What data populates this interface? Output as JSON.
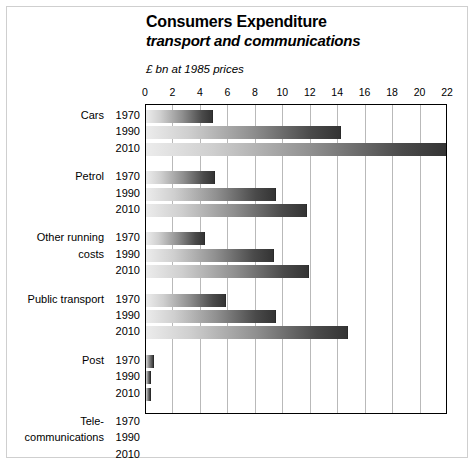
{
  "title": {
    "main": "Consumers Expenditure",
    "sub": "transport and communications"
  },
  "units": "£ bn at 1985 prices",
  "chart_data": {
    "type": "bar",
    "orientation": "horizontal",
    "title": "Consumers Expenditure transport and communications",
    "subtitle": "transport and communications",
    "xlabel": "£ bn at 1985 prices",
    "ylabel": "",
    "xlim": [
      0,
      22
    ],
    "xticks": [
      0,
      2,
      4,
      6,
      8,
      10,
      12,
      14,
      16,
      18,
      20,
      22
    ],
    "xtick_labels": [
      "0",
      "2",
      "4",
      "6",
      "8",
      "10",
      "12",
      "14",
      "16",
      "18",
      "20",
      "22"
    ],
    "grid": "vertical",
    "legend": "none",
    "categories": [
      "Cars",
      "Petrol",
      "Other running costs",
      "Public transport",
      "Post",
      "Tele-communications"
    ],
    "category_label_lines": [
      [
        "Cars"
      ],
      [
        "Petrol"
      ],
      [
        "Other running",
        "costs"
      ],
      [
        "Public transport"
      ],
      [
        "Post"
      ],
      [
        "Tele-",
        "communications"
      ]
    ],
    "years": [
      "1970",
      "1990",
      "2010"
    ],
    "series": [
      {
        "name": "1970",
        "values": [
          4.9,
          5.0,
          4.3,
          5.8,
          0.6,
          1.1
        ]
      },
      {
        "name": "1990",
        "values": [
          14.2,
          9.5,
          9.3,
          9.5,
          0.4,
          5.1
        ]
      },
      {
        "name": "2010",
        "values": [
          22.0,
          11.7,
          11.9,
          14.7,
          0.4,
          13.8
        ]
      }
    ],
    "bars": [
      {
        "category": "Cars",
        "year": "1970",
        "value": 4.9
      },
      {
        "category": "Cars",
        "year": "1990",
        "value": 14.2
      },
      {
        "category": "Cars",
        "year": "2010",
        "value": 22.0
      },
      {
        "category": "Petrol",
        "year": "1970",
        "value": 5.0
      },
      {
        "category": "Petrol",
        "year": "1990",
        "value": 9.5
      },
      {
        "category": "Petrol",
        "year": "2010",
        "value": 11.7
      },
      {
        "category": "Other running costs",
        "year": "1970",
        "value": 4.3
      },
      {
        "category": "Other running costs",
        "year": "1990",
        "value": 9.3
      },
      {
        "category": "Other running costs",
        "year": "2010",
        "value": 11.9
      },
      {
        "category": "Public transport",
        "year": "1970",
        "value": 5.8
      },
      {
        "category": "Public transport",
        "year": "1990",
        "value": 9.5
      },
      {
        "category": "Public transport",
        "year": "2010",
        "value": 14.7
      },
      {
        "category": "Post",
        "year": "1970",
        "value": 0.6
      },
      {
        "category": "Post",
        "year": "1990",
        "value": 0.4
      },
      {
        "category": "Post",
        "year": "2010",
        "value": 0.4
      },
      {
        "category": "Tele-communications",
        "year": "1970",
        "value": 1.1
      },
      {
        "category": "Tele-communications",
        "year": "1990",
        "value": 5.1
      },
      {
        "category": "Tele-communications",
        "year": "2010",
        "value": 13.8
      }
    ],
    "colors": {
      "bar_gradient_start": "#ececec",
      "bar_gradient_end": "#343434",
      "gridline": "#b9b9b9",
      "axis": "#000000",
      "background": "#ffffff",
      "frame": "#cfcfcf"
    }
  }
}
